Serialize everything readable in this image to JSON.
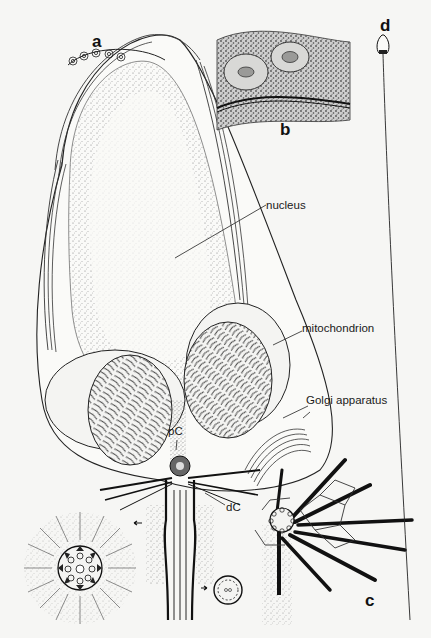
{
  "figure": {
    "type": "biological-illustration",
    "panels": {
      "a": {
        "letter": "a"
      },
      "b": {
        "letter": "b"
      },
      "c": {
        "letter": "c"
      },
      "d": {
        "letter": "d"
      }
    },
    "labels": {
      "nucleus": "nucleus",
      "mitochondrion": "mitochondrion",
      "golgi": "Golgi apparatus",
      "proximal_centriole": "pC",
      "distal_centriole": "dC"
    },
    "colors": {
      "background": "#f6f6f4",
      "ink": "#111111",
      "stipple": "#555555"
    }
  }
}
